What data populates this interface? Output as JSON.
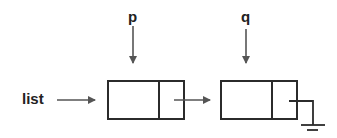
{
  "diagram": {
    "type": "linked-list",
    "labels": {
      "list": "list",
      "p": "p",
      "q": "q"
    },
    "nodes": [
      {
        "id": "node-1",
        "fields": [
          "info",
          "next"
        ],
        "pointed_by": "p",
        "next": "node-2"
      },
      {
        "id": "node-2",
        "fields": [
          "info",
          "next"
        ],
        "pointed_by": "q",
        "next": "null"
      }
    ],
    "head_pointer": "list",
    "terminator": "ground-null-symbol"
  },
  "colors": {
    "box_stroke": "#2b2b2b",
    "arrow": "#555555",
    "text": "#222222",
    "background": "#ffffff"
  }
}
